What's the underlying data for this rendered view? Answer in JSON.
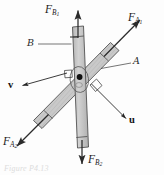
{
  "figure": {
    "kind": "free-body-diagram",
    "caption": "Figure P4.13",
    "colors": {
      "bar_fill": "#c9c9c9",
      "bar_stroke": "#4a4a4a",
      "arrow": "#2b2b2b",
      "leader": "#3a3a3a",
      "background": "#fdfdfd",
      "text": "#1b1b1b"
    },
    "bars": [
      {
        "name": "bar-A",
        "label": "A",
        "orientation": "diagonal-lower-left-to-upper-right"
      },
      {
        "name": "bar-B",
        "label": "B",
        "orientation": "near-vertical"
      }
    ],
    "hinge": {
      "name": "pin-joint",
      "marker": "filled-dot"
    },
    "right_angles": [
      {
        "name": "right-angle-mark-left"
      },
      {
        "name": "right-angle-mark-right"
      }
    ],
    "forces": [
      {
        "name": "force-FB1",
        "symbol": "F",
        "subscript": "B1",
        "direction": "up",
        "applied_to": "bar-B"
      },
      {
        "name": "force-FA1",
        "symbol": "F",
        "subscript": "A1",
        "direction": "up-right",
        "applied_to": "bar-A"
      },
      {
        "name": "force-FA2",
        "symbol": "F",
        "subscript": "A2",
        "direction": "down-left",
        "applied_to": "bar-A"
      },
      {
        "name": "force-FB2",
        "symbol": "F",
        "subscript": "B2",
        "direction": "down",
        "applied_to": "bar-B"
      }
    ],
    "vectors": [
      {
        "name": "unit-vector-v",
        "label": "v",
        "direction": "left",
        "perpendicular_to": "bar-A"
      },
      {
        "name": "unit-vector-u",
        "label": "u",
        "direction": "down-right",
        "perpendicular_to": "bar-B"
      }
    ],
    "leaders": [
      {
        "name": "leader-line-B",
        "from": "label-B",
        "to": "bar-B"
      },
      {
        "name": "leader-line-A",
        "from": "label-A",
        "to": "bar-A"
      }
    ]
  }
}
